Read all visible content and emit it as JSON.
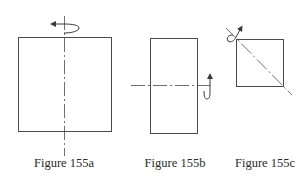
{
  "figures": [
    {
      "id": "a",
      "caption": "Figure 155a",
      "shape": "square",
      "axis": "vertical",
      "rotation_arrow": "curved arrow around top of vertical axis, pointing left"
    },
    {
      "id": "b",
      "caption": "Figure 155b",
      "shape": "tall rectangle",
      "axis": "horizontal",
      "rotation_arrow": "curved arrow around right end of horizontal axis, pointing up"
    },
    {
      "id": "c",
      "caption": "Figure 155c",
      "shape": "small square",
      "axis": "diagonal",
      "rotation_arrow": "curved arrow around upper-left end of diagonal axis"
    }
  ],
  "colors": {
    "line": "#4a4a4a",
    "text": "#2a2a2a",
    "background": "#ffffff"
  }
}
